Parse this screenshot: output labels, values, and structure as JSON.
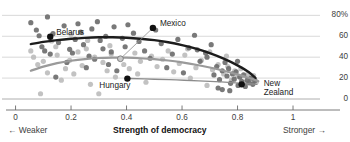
{
  "chart_data": {
    "type": "scatter",
    "title": "",
    "subtitle": "",
    "xlabel": "Strength of democracy",
    "ylabel": "",
    "xlim": [
      -0.02,
      1.09
    ],
    "ylim": [
      0,
      88
    ],
    "grid": true,
    "legend_position": "none",
    "x_ticks": [
      "0",
      "0.2",
      "0.4",
      "0.6",
      "0.8",
      "1"
    ],
    "x_tick_values": [
      0,
      0.2,
      0.4,
      0.6,
      0.8,
      1
    ],
    "y_ticks": [
      "80%",
      "60",
      "40",
      "20",
      "0"
    ],
    "y_tick_values": [
      80,
      60,
      40,
      20,
      0
    ],
    "x_axis_left_caption": "← Weaker",
    "x_axis_right_caption": "Stronger →",
    "source_note": "",
    "annotations": [
      {
        "label": "Belarus",
        "x": 0.125,
        "y": 59.5,
        "lines": [
          "Belarus"
        ],
        "label_dx": 6,
        "label_dy": -4,
        "leader": false
      },
      {
        "label": "Mexico",
        "x": 0.495,
        "y": 68.0,
        "lines": [
          "Mexico"
        ],
        "label_dx": 7,
        "label_dy": -4,
        "leader": true,
        "leader_to_x": 0.378,
        "leader_to_y": 38.5
      },
      {
        "label": "Hungary",
        "x": 0.403,
        "y": 19.5,
        "lines": [
          "Hungary"
        ],
        "label_dx": -28,
        "label_dy": 7,
        "leader": false
      },
      {
        "label": "New Zealand",
        "x": 0.815,
        "y": 14.0,
        "lines": [
          "New",
          "Zealand"
        ],
        "label_dx": 22,
        "label_dy": 0,
        "leader": false
      }
    ],
    "series": [
      {
        "name": "trend-dark",
        "type": "line",
        "color": "#1c1c1c",
        "width": 2.4,
        "points": [
          [
            0.055,
            52.5
          ],
          [
            0.1,
            54.6
          ],
          [
            0.15,
            56.3
          ],
          [
            0.2,
            57.6
          ],
          [
            0.25,
            58.5
          ],
          [
            0.3,
            59.0
          ],
          [
            0.35,
            59.0
          ],
          [
            0.4,
            58.6
          ],
          [
            0.45,
            57.7
          ],
          [
            0.5,
            56.3
          ],
          [
            0.55,
            54.3
          ],
          [
            0.6,
            51.6
          ],
          [
            0.65,
            48.2
          ],
          [
            0.7,
            43.9
          ],
          [
            0.75,
            38.6
          ],
          [
            0.8,
            32.2
          ],
          [
            0.84,
            25.8
          ],
          [
            0.865,
            20.0
          ]
        ]
      },
      {
        "name": "trend-mid",
        "type": "line",
        "color": "#9a9a9a",
        "width": 2.2,
        "points": [
          [
            0.055,
            27.0
          ],
          [
            0.1,
            31.0
          ],
          [
            0.15,
            34.3
          ],
          [
            0.2,
            36.6
          ],
          [
            0.25,
            38.2
          ],
          [
            0.3,
            39.2
          ],
          [
            0.35,
            39.6
          ],
          [
            0.4,
            39.5
          ],
          [
            0.45,
            39.0
          ],
          [
            0.5,
            38.1
          ],
          [
            0.55,
            36.8
          ],
          [
            0.6,
            35.0
          ],
          [
            0.65,
            32.8
          ],
          [
            0.7,
            30.1
          ],
          [
            0.75,
            27.0
          ],
          [
            0.8,
            23.5
          ],
          [
            0.845,
            19.8
          ],
          [
            0.875,
            17.0
          ]
        ]
      },
      {
        "name": "trend-low",
        "type": "line",
        "color": "#8c8c8c",
        "width": 1.3,
        "points": [
          [
            0.41,
            19.6
          ],
          [
            0.5,
            18.9
          ],
          [
            0.58,
            18.2
          ],
          [
            0.66,
            17.4
          ],
          [
            0.72,
            16.6
          ],
          [
            0.78,
            15.7
          ],
          [
            0.83,
            14.8
          ],
          [
            0.87,
            14.0
          ]
        ]
      }
    ],
    "scatter_dark": {
      "name": "dark-dots",
      "color": "#6e6e6e",
      "radius": 2.6,
      "points": [
        [
          0.055,
          73.0
        ],
        [
          0.075,
          66.0
        ],
        [
          0.085,
          60.5
        ],
        [
          0.095,
          50.0
        ],
        [
          0.105,
          46.0
        ],
        [
          0.115,
          78.5
        ],
        [
          0.125,
          43.0
        ],
        [
          0.135,
          62.5
        ],
        [
          0.145,
          21.0
        ],
        [
          0.155,
          54.0
        ],
        [
          0.175,
          70.0
        ],
        [
          0.185,
          35.0
        ],
        [
          0.195,
          47.5
        ],
        [
          0.205,
          44.0
        ],
        [
          0.215,
          57.0
        ],
        [
          0.225,
          72.0
        ],
        [
          0.235,
          64.0
        ],
        [
          0.245,
          52.0
        ],
        [
          0.255,
          30.0
        ],
        [
          0.265,
          41.0
        ],
        [
          0.275,
          67.0
        ],
        [
          0.285,
          38.0
        ],
        [
          0.295,
          74.0
        ],
        [
          0.305,
          56.0
        ],
        [
          0.315,
          48.0
        ],
        [
          0.325,
          60.0
        ],
        [
          0.335,
          33.0
        ],
        [
          0.345,
          45.0
        ],
        [
          0.355,
          69.0
        ],
        [
          0.365,
          27.0
        ],
        [
          0.385,
          58.0
        ],
        [
          0.395,
          50.0
        ],
        [
          0.405,
          71.0
        ],
        [
          0.425,
          63.0
        ],
        [
          0.445,
          55.0
        ],
        [
          0.465,
          46.0
        ],
        [
          0.485,
          39.0
        ],
        [
          0.505,
          66.0
        ],
        [
          0.525,
          53.0
        ],
        [
          0.545,
          30.0
        ],
        [
          0.565,
          43.0
        ],
        [
          0.585,
          57.0
        ],
        [
          0.605,
          25.0
        ],
        [
          0.625,
          49.0
        ],
        [
          0.645,
          61.0
        ],
        [
          0.665,
          36.0
        ],
        [
          0.685,
          44.0
        ],
        [
          0.705,
          52.0
        ],
        [
          0.715,
          23.0
        ],
        [
          0.725,
          31.0
        ],
        [
          0.735,
          18.5
        ],
        [
          0.745,
          27.0
        ],
        [
          0.755,
          35.0
        ],
        [
          0.762,
          22.0
        ],
        [
          0.768,
          29.0
        ],
        [
          0.775,
          15.0
        ],
        [
          0.782,
          24.0
        ],
        [
          0.788,
          19.0
        ],
        [
          0.795,
          26.0
        ],
        [
          0.802,
          13.0
        ],
        [
          0.808,
          21.0
        ],
        [
          0.815,
          17.0
        ],
        [
          0.822,
          23.0
        ],
        [
          0.828,
          12.0
        ],
        [
          0.835,
          18.0
        ],
        [
          0.842,
          15.5
        ],
        [
          0.848,
          20.0
        ],
        [
          0.855,
          14.0
        ],
        [
          0.862,
          17.5
        ],
        [
          0.655,
          47.0
        ],
        [
          0.69,
          40.0
        ],
        [
          0.73,
          10.5
        ],
        [
          0.745,
          9.0
        ],
        [
          0.772,
          8.0
        ],
        [
          0.8,
          36.0
        ]
      ]
    },
    "scatter_light": {
      "name": "light-dots",
      "color": "#bdbdbd",
      "radius": 2.6,
      "points": [
        [
          0.065,
          40.0
        ],
        [
          0.08,
          33.0
        ],
        [
          0.09,
          5.0
        ],
        [
          0.1,
          36.0
        ],
        [
          0.115,
          25.0
        ],
        [
          0.13,
          55.5
        ],
        [
          0.15,
          42.0
        ],
        [
          0.165,
          18.0
        ],
        [
          0.18,
          29.0
        ],
        [
          0.195,
          37.0
        ],
        [
          0.21,
          24.0
        ],
        [
          0.225,
          45.0
        ],
        [
          0.24,
          32.0
        ],
        [
          0.255,
          48.0
        ],
        [
          0.27,
          14.0
        ],
        [
          0.285,
          40.0
        ],
        [
          0.3,
          5.0
        ],
        [
          0.315,
          35.0
        ],
        [
          0.33,
          27.0
        ],
        [
          0.345,
          43.0
        ],
        [
          0.36,
          21.0
        ],
        [
          0.375,
          38.5
        ],
        [
          0.39,
          33.0
        ],
        [
          0.41,
          29.0
        ],
        [
          0.43,
          44.0
        ],
        [
          0.45,
          36.0
        ],
        [
          0.47,
          16.0
        ],
        [
          0.49,
          41.0
        ],
        [
          0.51,
          31.0
        ],
        [
          0.53,
          38.0
        ],
        [
          0.55,
          46.0
        ],
        [
          0.57,
          26.0
        ],
        [
          0.59,
          34.0
        ],
        [
          0.61,
          42.0
        ],
        [
          0.63,
          20.0
        ],
        [
          0.65,
          30.0
        ],
        [
          0.67,
          37.0
        ],
        [
          0.69,
          13.0
        ],
        [
          0.71,
          28.0
        ],
        [
          0.73,
          33.0
        ],
        [
          0.75,
          24.0
        ],
        [
          0.765,
          31.0
        ],
        [
          0.778,
          18.0
        ],
        [
          0.79,
          27.0
        ],
        [
          0.8,
          22.0
        ],
        [
          0.812,
          29.0
        ],
        [
          0.825,
          16.0
        ],
        [
          0.838,
          24.0
        ],
        [
          0.85,
          19.0
        ],
        [
          0.858,
          22.5
        ],
        [
          0.868,
          16.5
        ],
        [
          0.2,
          62.0
        ],
        [
          0.26,
          56.0
        ],
        [
          0.145,
          50.0
        ],
        [
          0.055,
          46.0
        ],
        [
          0.34,
          51.0
        ],
        [
          0.44,
          24.0
        ],
        [
          0.62,
          48.0
        ],
        [
          0.7,
          45.0
        ],
        [
          0.76,
          41.0
        ]
      ]
    }
  }
}
